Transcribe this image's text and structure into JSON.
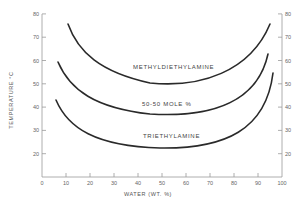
{
  "chart_data": {
    "type": "line",
    "title": "",
    "xlabel": "WATER (WT. %)",
    "ylabel": "TEMPERATURE °C",
    "xlim": [
      0,
      100
    ],
    "ylim": [
      10,
      80
    ],
    "x_ticks": [
      0,
      10,
      20,
      30,
      40,
      50,
      60,
      70,
      80,
      90,
      100
    ],
    "y_ticks": [
      20,
      30,
      40,
      50,
      60,
      70,
      80
    ],
    "grid": false,
    "legend": "inline curve labels",
    "series": [
      {
        "name": "METHYLDIETHYLAMINE",
        "x": [
          11,
          15,
          20,
          30,
          40,
          50,
          60,
          70,
          80,
          88,
          92,
          95
        ],
        "y": [
          75.5,
          66,
          60,
          54,
          51,
          50,
          50.5,
          52,
          56,
          62,
          68,
          75.5
        ]
      },
      {
        "name": "50-50 MOLE %",
        "x": [
          7,
          10,
          15,
          20,
          30,
          40,
          50,
          60,
          70,
          80,
          88,
          92,
          94
        ],
        "y": [
          59,
          52,
          46,
          42.5,
          39,
          37,
          36.5,
          37,
          38.5,
          42,
          48,
          55,
          63
        ]
      },
      {
        "name": "TRIETHYLAMINE",
        "x": [
          6,
          10,
          15,
          20,
          30,
          40,
          50,
          60,
          70,
          80,
          88,
          93,
          96
        ],
        "y": [
          43,
          36,
          31,
          28,
          24.5,
          22.5,
          22,
          22.5,
          24,
          28,
          35,
          44,
          55
        ]
      }
    ]
  },
  "axes": {
    "y_tick_labels": [
      "80",
      "70",
      "60",
      "50",
      "40",
      "30",
      "20"
    ],
    "x_tick_labels": [
      "0",
      "10",
      "20",
      "30",
      "40",
      "50",
      "60",
      "70",
      "80",
      "90",
      "100"
    ],
    "x_title": "WATER (WT. %)",
    "y_title": "TEMPERATURE °C"
  },
  "labels": {
    "methyldiethylamine": "METHYLDIETHYLAMINE",
    "fifty_fifty": "50-50 MOLE %",
    "triethylamine": "TRIETHYLAMINE"
  },
  "colors": {
    "curve": "#2a2a2a",
    "axis": "#999999",
    "text": "#555555"
  }
}
